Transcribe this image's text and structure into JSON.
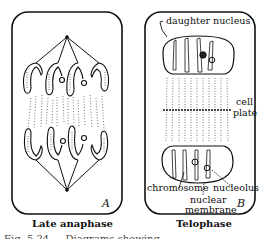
{
  "figure": {
    "caption_clipped": "Fig. 5.24 — Diagrams showing ...",
    "panels": [
      {
        "id": "A",
        "letter": "A",
        "title": "Late anaphase"
      },
      {
        "id": "B",
        "letter": "B",
        "title": "Telophase",
        "labels": {
          "daughter_nucleus": "daughter nucleus",
          "cell_plate_1": "cell",
          "cell_plate_2": "plate",
          "chromosome": "chromosome",
          "nucleolus": "nucleolus",
          "nuclear_membrane_1": "nuclear",
          "nuclear_membrane_2": "membrane"
        }
      }
    ]
  }
}
